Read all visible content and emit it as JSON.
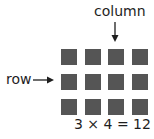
{
  "diagram": {
    "column_label": "column",
    "row_label": "row",
    "equation": "3 × 4 = 12",
    "rows": 3,
    "columns": 4,
    "square_color": "#555555"
  }
}
